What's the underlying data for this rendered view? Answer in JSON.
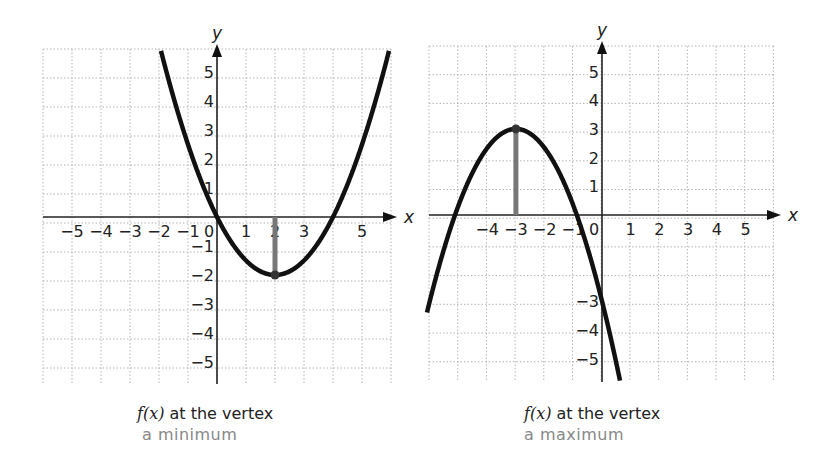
{
  "chart_data": [
    {
      "type": "line",
      "title": "f(x) at the vertex a minimum",
      "caption_line1_fn": "f(x)",
      "caption_line1_rest": " at the vertex",
      "caption_line2": "a minimum",
      "xlabel": "x",
      "ylabel": "y",
      "xlim": [
        -6,
        6
      ],
      "ylim": [
        -6,
        6
      ],
      "grid": true,
      "x_ticks": [
        "−5",
        "−4",
        "−3",
        "−2",
        "−1",
        "0",
        "1",
        "2",
        "3",
        "5"
      ],
      "y_ticks": [
        "5",
        "4",
        "3",
        "2",
        "1",
        "−1",
        "−2",
        "−3",
        "−4",
        "−5"
      ],
      "function": "f(x) = 0.5(x − 2)² − 2",
      "coeffs": {
        "a": 0.5,
        "h": 2,
        "k": -2
      },
      "vertex": {
        "x": 2,
        "y": -2,
        "kind": "minimum"
      },
      "roots": [
        0,
        4
      ],
      "series": [
        {
          "name": "f(x)",
          "x": [
            -1.5,
            -1,
            0,
            1,
            2,
            3,
            4,
            5,
            5.5
          ],
          "y": [
            4.125,
            2.5,
            0,
            -1.5,
            -2,
            -1.5,
            0,
            2.5,
            4.125
          ]
        }
      ]
    },
    {
      "type": "line",
      "title": "f(x) at the vertex a maximum",
      "caption_line1_fn": "f(x)",
      "caption_line1_rest": " at the vertex",
      "caption_line2": "a maximum",
      "xlabel": "x",
      "ylabel": "y",
      "xlim": [
        -6,
        6
      ],
      "ylim": [
        -6,
        6
      ],
      "grid": true,
      "x_ticks": [
        "−4",
        "−3",
        "−2",
        "−1",
        "0",
        "1",
        "2",
        "3",
        "4",
        "5"
      ],
      "y_ticks": [
        "5",
        "4",
        "3",
        "2",
        "1",
        "−3",
        "−4",
        "−5"
      ],
      "function": "f(x) = −(2/3)(x + 3)² + 3",
      "coeffs": {
        "a": -0.6667,
        "h": -3,
        "k": 3
      },
      "vertex": {
        "x": -3,
        "y": 3,
        "kind": "maximum"
      },
      "roots": [
        -5.12,
        -0.88
      ],
      "series": [
        {
          "name": "f(x)",
          "x": [
            -6,
            -5,
            -4,
            -3,
            -2,
            -1,
            0
          ],
          "y": [
            -3,
            0.33,
            2.33,
            3,
            2.33,
            0.33,
            -3
          ]
        }
      ]
    }
  ]
}
